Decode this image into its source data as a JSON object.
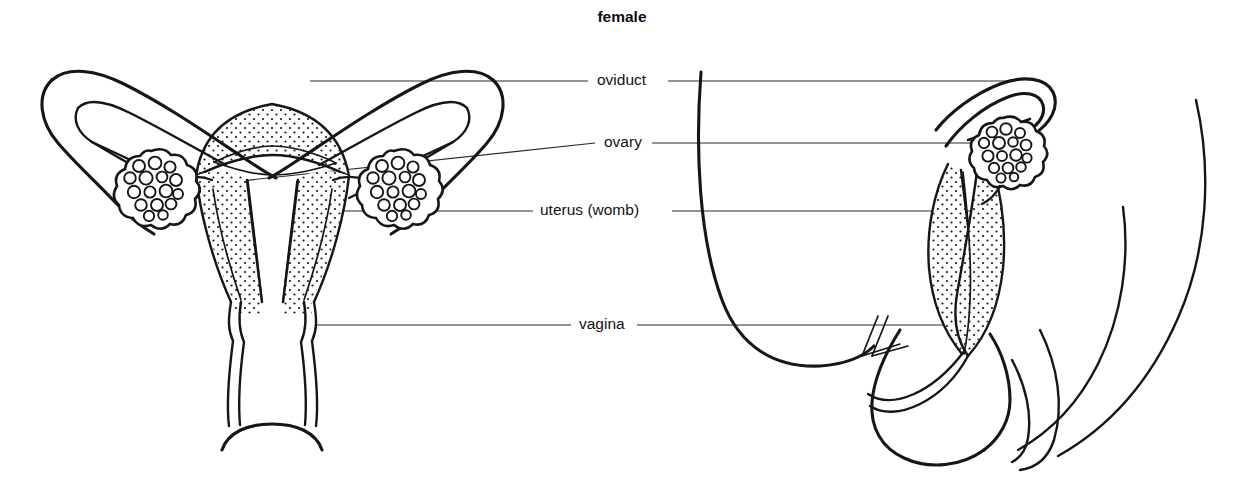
{
  "figure": {
    "title": "female",
    "title_position": {
      "x": 622,
      "y": 18
    },
    "background_color": "#ffffff",
    "ink_color": "#16161a",
    "leader_color": "#2a2a2e"
  },
  "labels": [
    {
      "id": "oviduct",
      "text": "oviduct",
      "text_x": 597,
      "text_y": 81,
      "anchor": "start",
      "left_leader": {
        "x1": 310,
        "y1": 81,
        "x2": 588,
        "y2": 81
      },
      "right_leader": {
        "x1": 668,
        "y1": 81,
        "x2": 1010,
        "y2": 81
      }
    },
    {
      "id": "ovary",
      "text": "ovary",
      "text_x": 604,
      "text_y": 143,
      "anchor": "start",
      "left_leader": {
        "x1": 175,
        "y1": 188,
        "x2": 595,
        "y2": 143
      },
      "right_leader": {
        "x1": 652,
        "y1": 143,
        "x2": 1005,
        "y2": 143
      }
    },
    {
      "id": "uterus",
      "text": "uterus (womb)",
      "text_x": 540,
      "text_y": 211,
      "anchor": "start",
      "left_leader": {
        "x1": 300,
        "y1": 211,
        "x2": 533,
        "y2": 211
      },
      "right_leader": {
        "x1": 672,
        "y1": 211,
        "x2": 1000,
        "y2": 211
      }
    },
    {
      "id": "vagina",
      "text": "vagina",
      "text_x": 579,
      "text_y": 325,
      "anchor": "start",
      "left_leader": {
        "x1": 300,
        "y1": 325,
        "x2": 571,
        "y2": 325
      },
      "right_leader": {
        "x1": 637,
        "y1": 325,
        "x2": 955,
        "y2": 325
      }
    }
  ],
  "views": {
    "frontal": {
      "name": "frontal section of uterus, oviducts, ovaries and vagina",
      "parts": [
        "left oviduct",
        "right oviduct",
        "left ovary",
        "right ovary",
        "uterus body with stippled muscular wall",
        "uterine cavity",
        "cervix",
        "vagina"
      ]
    },
    "lateral": {
      "name": "side section showing uterus tilted over the bladder",
      "parts": [
        "oviduct hooking over the ovary",
        "ovary",
        "uterus with stippled wall",
        "vagina",
        "bladder outline",
        "body contour"
      ]
    }
  },
  "ovaries": [
    {
      "id": "ovary-left-frontal",
      "cx": 151,
      "cy": 184,
      "r": 33,
      "follicle_count": 16
    },
    {
      "id": "ovary-right-frontal",
      "cx": 394,
      "cy": 184,
      "r": 33,
      "follicle_count": 16
    },
    {
      "id": "ovary-lateral",
      "cx": 1003,
      "cy": 147,
      "r": 30,
      "follicle_count": 16
    }
  ]
}
